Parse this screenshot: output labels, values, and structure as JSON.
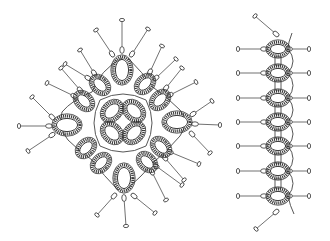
{
  "figure": {
    "colors": {
      "line": "#333333",
      "background": "#ffffff"
    }
  },
  "motif": {
    "center": [
      123,
      122
    ],
    "center_clover": [
      {
        "cx": 112,
        "cy": 111,
        "rx": 8,
        "ry": 11,
        "rot": 45
      },
      {
        "cx": 134,
        "cy": 111,
        "rx": 8,
        "ry": 11,
        "rot": -45
      },
      {
        "cx": 112,
        "cy": 133,
        "rx": 8,
        "ry": 11,
        "rot": -45
      },
      {
        "cx": 134,
        "cy": 133,
        "rx": 8,
        "ry": 11,
        "rot": 45
      }
    ],
    "big_rings": [
      {
        "cx": 122,
        "cy": 70,
        "rx": 9,
        "ry": 13,
        "rot": 0
      },
      {
        "cx": 67,
        "cy": 125,
        "rx": 13,
        "ry": 9,
        "rot": 0
      },
      {
        "cx": 124,
        "cy": 178,
        "rx": 9,
        "ry": 13,
        "rot": 0
      },
      {
        "cx": 177,
        "cy": 122,
        "rx": 13,
        "ry": 9,
        "rot": 0
      }
    ],
    "side_rings": [
      {
        "cx": 100,
        "cy": 85,
        "rot": -45
      },
      {
        "cx": 84,
        "cy": 101,
        "rot": -45
      },
      {
        "cx": 145,
        "cy": 84,
        "rot": 45
      },
      {
        "cx": 160,
        "cy": 100,
        "rot": 45
      },
      {
        "cx": 86,
        "cy": 148,
        "rot": 45
      },
      {
        "cx": 101,
        "cy": 163,
        "rot": 45
      },
      {
        "cx": 147,
        "cy": 162,
        "rot": -45
      },
      {
        "cx": 161,
        "cy": 147,
        "rot": -45
      }
    ],
    "pins": [
      {
        "from": [
          122,
          50
        ],
        "to": [
          122,
          20
        ]
      },
      {
        "from": [
          112,
          54
        ],
        "to": [
          96,
          30
        ]
      },
      {
        "from": [
          132,
          54
        ],
        "to": [
          148,
          29
        ]
      },
      {
        "from": [
          94,
          73
        ],
        "to": [
          80,
          50
        ]
      },
      {
        "from": [
          88,
          78
        ],
        "to": [
          65,
          64
        ]
      },
      {
        "from": [
          150,
          72
        ],
        "to": [
          162,
          46
        ]
      },
      {
        "from": [
          156,
          78
        ],
        "to": [
          176,
          59
        ]
      },
      {
        "from": [
          80,
          90
        ],
        "to": [
          61,
          68
        ]
      },
      {
        "from": [
          74,
          96
        ],
        "to": [
          47,
          83
        ]
      },
      {
        "from": [
          166,
          88
        ],
        "to": [
          182,
          68
        ]
      },
      {
        "from": [
          170,
          95
        ],
        "to": [
          196,
          82
        ]
      },
      {
        "from": [
          52,
          117
        ],
        "to": [
          32,
          97
        ]
      },
      {
        "from": [
          49,
          126
        ],
        "to": [
          19,
          126
        ]
      },
      {
        "from": [
          52,
          135
        ],
        "to": [
          28,
          151
        ]
      },
      {
        "from": [
          193,
          114
        ],
        "to": [
          212,
          101
        ]
      },
      {
        "from": [
          195,
          124
        ],
        "to": [
          220,
          125
        ]
      },
      {
        "from": [
          192,
          134
        ],
        "to": [
          210,
          153
        ]
      },
      {
        "from": [
          170,
          152
        ],
        "to": [
          199,
          164
        ]
      },
      {
        "from": [
          165,
          158
        ],
        "to": [
          184,
          180
        ]
      },
      {
        "from": [
          156,
          166
        ],
        "to": [
          182,
          185
        ]
      },
      {
        "from": [
          152,
          172
        ],
        "to": [
          166,
          200
        ]
      },
      {
        "from": [
          114,
          196
        ],
        "to": [
          97,
          215
        ]
      },
      {
        "from": [
          124,
          198
        ],
        "to": [
          126,
          226
        ]
      },
      {
        "from": [
          134,
          196
        ],
        "to": [
          155,
          213
        ]
      }
    ]
  },
  "strip": {
    "x": 278,
    "rings_y": [
      49,
      73,
      98,
      122,
      146,
      171,
      196
    ],
    "left_pin_x": 238,
    "right_pin_x": 309,
    "top_pin": {
      "from": [
        276,
        34
      ],
      "to": [
        255,
        16
      ]
    },
    "bottom_pin": {
      "from": [
        276,
        212
      ],
      "to": [
        256,
        229
      ]
    }
  }
}
